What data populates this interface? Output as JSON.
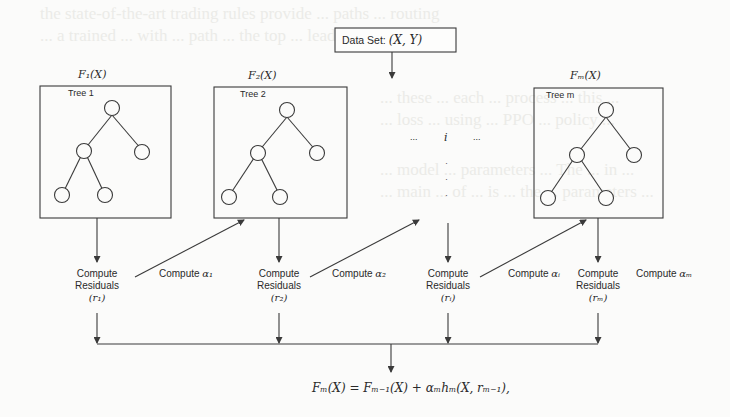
{
  "background_bleed": [
    "the state-of-the-art trading rules provide ... paths ... routing",
    "... a trained ... with ... path ... the top ... leader",
    "... these ... each ... process ... this ...",
    "... loss ... using ... PPO ... policy ...",
    "... model ... parameters ... The ... in ...",
    "... main ... of ... is ... the ... parameters ..."
  ],
  "dataset": {
    "label": "Data Set:",
    "math": "(X, Y)"
  },
  "trees": [
    {
      "function": "F₁(X)",
      "label": "Tree 1"
    },
    {
      "function": "F₂(X)",
      "label": "Tree 2"
    },
    {
      "function": "Fₘ(X)",
      "label": "Tree m"
    }
  ],
  "ellipsis": {
    "left": "...",
    "index": "i",
    "right": "...",
    "vertical": "⋮"
  },
  "residuals": [
    {
      "line1": "Compute",
      "line2": "Residuals",
      "var": "(r₁)"
    },
    {
      "line1": "Compute",
      "line2": "Residuals",
      "var": "(r₂)"
    },
    {
      "line1": "Compute",
      "line2": "Residuals",
      "var": "(rᵢ)"
    },
    {
      "line1": "Compute",
      "line2": "Residuals",
      "var": "(rₘ)"
    }
  ],
  "alphas": [
    {
      "label": "Compute",
      "var": "α₁"
    },
    {
      "label": "Compute",
      "var": "α₂"
    },
    {
      "label": "Compute",
      "var": "αᵢ"
    },
    {
      "label": "Compute",
      "var": "αₘ"
    }
  ],
  "formula": "Fₘ(X) = Fₘ₋₁(X) + αₘhₘ(X, rₘ₋₁),",
  "colors": {
    "stroke": "#3a3a3a",
    "background": "#fbfbfa",
    "text": "#2a2a2a"
  }
}
